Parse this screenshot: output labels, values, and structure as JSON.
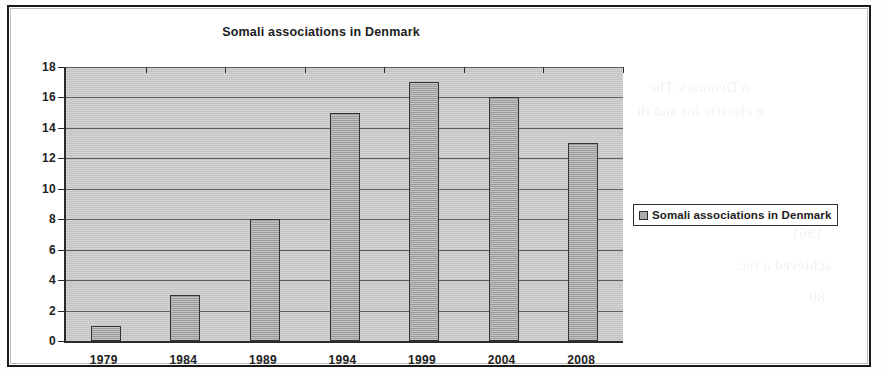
{
  "chart_data": {
    "type": "bar",
    "title": "Somali associations in Denmark",
    "categories": [
      "1979",
      "1984",
      "1989",
      "1994",
      "1999",
      "2004",
      "2008"
    ],
    "values": [
      1,
      3,
      8,
      15,
      17,
      16,
      13
    ],
    "series": [
      {
        "name": "Somali associations in Denmark",
        "values": [
          1,
          3,
          8,
          15,
          17,
          16,
          13
        ]
      }
    ],
    "xlabel": "",
    "ylabel": "",
    "ylim": [
      0,
      18
    ],
    "yticks": [
      0,
      2,
      4,
      6,
      8,
      10,
      12,
      14,
      16,
      18
    ],
    "grid": true,
    "legend": {
      "position": "right",
      "entries": [
        "Somali associations in Denmark"
      ]
    },
    "colors": {
      "bar_fill": "#ababab",
      "bar_border": "#333333",
      "plot_background": "#c9c9c9",
      "gridline": "#4a4a4a",
      "axis": "#2b2b2b",
      "text": "#1d1d1d"
    }
  },
  "legend": {
    "label": "Somali associations in Denmark",
    "swatch_icon": "square-swatch-icon"
  },
  "ghost_text": {
    "line1": "n Denmark  The",
    "line2": "e electric lor  and th",
    "line3": "1961",
    "line4": "achieved a rec",
    "line5": "80"
  }
}
